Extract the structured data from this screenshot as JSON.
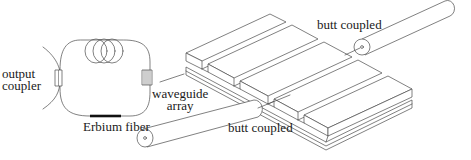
{
  "diagram": {
    "labels": {
      "output_coupler_line1": "output",
      "output_coupler_line2": "coupler",
      "erbium_fiber": "Erbium fiber",
      "waveguide_array_line1": "waveguide",
      "waveguide_array_line2": "array",
      "butt_coupled_top": "butt coupled",
      "butt_coupled_bottom": "butt coupled"
    },
    "components": [
      {
        "id": "fiber-ring-loop",
        "name": "fiber ring loop"
      },
      {
        "id": "fiber-coil",
        "name": "fiber coil (3 turns)"
      },
      {
        "id": "output-coupler",
        "name": "output coupler"
      },
      {
        "id": "erbium-fiber",
        "name": "Erbium fiber"
      },
      {
        "id": "waveguide-array-grating",
        "name": "waveguide array"
      },
      {
        "id": "waveguide-chip",
        "name": "ridge waveguide chip"
      },
      {
        "id": "input-fiber",
        "name": "butt coupled fiber (bottom)"
      },
      {
        "id": "output-fiber",
        "name": "butt coupled fiber (top)"
      }
    ],
    "colors": {
      "line": "#4a4a4a",
      "erbium": "#111111",
      "background": "#ffffff"
    }
  }
}
